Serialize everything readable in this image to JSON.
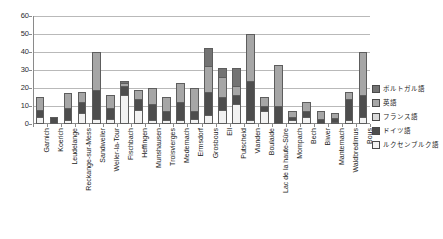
{
  "chart_data": {
    "type": "bar",
    "stacked": true,
    "title": "",
    "subtitle": "",
    "xlabel": "",
    "ylabel": "",
    "ylim": [
      0,
      60
    ],
    "ytick_step": 10,
    "yticks": [
      0,
      10,
      20,
      30,
      40,
      50,
      60
    ],
    "grid": true,
    "legend_position": "right",
    "categories": [
      "Garnich",
      "Koerich",
      "Leudelange",
      "Reckange-sur-Mess",
      "Sandweiler",
      "Weiler-la-Tour",
      "Fischbach",
      "Heffingen",
      "Munshausen",
      "Troisvierges",
      "Medernach",
      "Ermsdorf",
      "Grosbous",
      "Ell",
      "Putscheid",
      "Vianden",
      "Boulaide",
      "Lac de la haute-Sûre",
      "Mompach",
      "Bech",
      "Biwer",
      "Manternach",
      "Waldbredimus",
      "Bous"
    ],
    "series": [
      {
        "name": "ルクセンブルク語",
        "color": "#f2f2f2",
        "values": [
          4,
          0,
          2,
          6,
          3,
          3,
          16,
          8,
          2,
          2,
          2,
          3,
          5,
          8,
          11,
          2,
          7,
          0,
          2,
          4,
          0,
          1,
          2,
          4
        ]
      },
      {
        "name": "ドイツ語",
        "color": "#4d4d4d",
        "values": [
          4,
          4,
          7,
          6,
          16,
          6,
          5,
          6,
          9,
          5,
          10,
          4,
          13,
          7,
          5,
          22,
          3,
          10,
          2,
          3,
          3,
          2,
          12,
          12
        ]
      },
      {
        "name": "フランス語",
        "color": "#d9d9d9",
        "values": [
          0,
          0,
          0,
          0,
          0,
          0,
          0,
          0,
          0,
          0,
          0,
          0,
          0,
          0,
          0,
          0,
          0,
          0,
          0,
          0,
          0,
          0,
          0,
          0
        ]
      },
      {
        "name": "英語",
        "color": "#a6a6a6",
        "values": [
          7,
          0,
          8,
          6,
          21,
          7,
          2,
          5,
          9,
          8,
          11,
          13,
          14,
          11,
          5,
          26,
          5,
          23,
          3,
          5,
          4,
          3,
          4,
          24
        ]
      },
      {
        "name": "ポルトガル語",
        "color": "#737373",
        "values": [
          0,
          0,
          0,
          0,
          0,
          0,
          1,
          0,
          0,
          0,
          0,
          0,
          10,
          5,
          10,
          0,
          0,
          0,
          0,
          0,
          0,
          0,
          0,
          0
        ]
      }
    ],
    "totals": [
      15,
      4,
      17,
      18,
      40,
      16,
      24,
      19,
      20,
      15,
      23,
      20,
      42,
      31,
      31,
      50,
      15,
      33,
      7,
      12,
      7,
      6,
      18,
      40
    ]
  },
  "legend": {
    "items": [
      {
        "label": "ポルトガル語",
        "color": "#737373"
      },
      {
        "label": "英語",
        "color": "#a6a6a6"
      },
      {
        "label": "フランス語",
        "color": "#d9d9d9"
      },
      {
        "label": "ドイツ語",
        "color": "#4d4d4d"
      },
      {
        "label": "ルクセンブルク語",
        "color": "#f2f2f2"
      }
    ]
  }
}
